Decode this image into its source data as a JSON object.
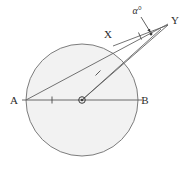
{
  "figure": {
    "kind": "circle-geometry-diagram",
    "canvas": {
      "width": 185,
      "height": 169
    },
    "colors": {
      "circle_fill": "#f2f2f2",
      "circle_stroke": "#6e6e6e",
      "line_stroke": "#5a5a5a",
      "label_color": "#2b2b2b",
      "background": "#ffffff"
    },
    "circle": {
      "cx": 82,
      "cy": 100,
      "r": 56
    },
    "center_marker": {
      "cx": 82,
      "cy": 100,
      "outer_r": 3.4,
      "inner_r": 1.4
    },
    "points": [
      {
        "name": "A",
        "label": "A",
        "x": 26,
        "y": 100,
        "label_x": 14,
        "label_y": 104
      },
      {
        "name": "B",
        "label": "B",
        "x": 138,
        "y": 100,
        "label_x": 143,
        "label_y": 104
      },
      {
        "name": "O",
        "label": "",
        "x": 82,
        "y": 100,
        "label_x": 82,
        "label_y": 100
      },
      {
        "name": "X",
        "label": "X",
        "x": 113,
        "y": 46,
        "label_x": 107,
        "label_y": 38
      },
      {
        "name": "Y",
        "label": "Y",
        "x": 168,
        "y": 24,
        "label_x": 172,
        "label_y": 22
      }
    ],
    "segments": [
      {
        "name": "diameter-AB",
        "from": "A",
        "to": "B",
        "x1": 22,
        "y1": 100,
        "x2": 142,
        "y2": 100
      },
      {
        "name": "chord-A-to-Y",
        "from": "A",
        "to": "Y",
        "x1": 26,
        "y1": 100,
        "x2": 168,
        "y2": 24
      },
      {
        "name": "radius-O-to-X-extended",
        "from": "O",
        "to": "Y",
        "x1": 82,
        "y1": 100,
        "x2": 160,
        "y2": 30
      },
      {
        "name": "line-O-to-Y",
        "from": "O",
        "to": "Y",
        "x1": 82,
        "y1": 100,
        "x2": 168,
        "y2": 25
      },
      {
        "name": "segment-X-to-Y",
        "from": "X",
        "to": "Y",
        "x1": 113,
        "y1": 46,
        "x2": 168,
        "y2": 25
      }
    ],
    "tick_marks": [
      {
        "name": "tick-on-AO",
        "x": 52,
        "y": 100,
        "angle": 90
      },
      {
        "name": "tick-on-OX",
        "x": 98,
        "y": 73,
        "angle": 42
      },
      {
        "name": "tick-on-XY",
        "x": 140,
        "y": 36,
        "angle": 69
      }
    ],
    "angle_annotation": {
      "name": "alpha-angle-at-Y",
      "label": "α°",
      "label_x": 137,
      "label_y": 14,
      "arrow_from_x": 141,
      "arrow_from_y": 18,
      "arrow_to_x": 150,
      "arrow_to_y": 33,
      "vertex": "Y"
    }
  }
}
